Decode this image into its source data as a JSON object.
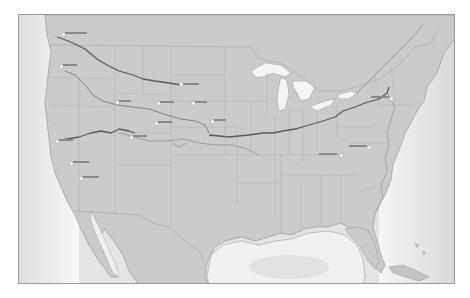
{
  "map": {
    "type": "reference-map",
    "region": "Contiguous United States",
    "style": "grayscale relief",
    "colors": {
      "land": "#c9c9c9",
      "water": "#ececec",
      "deep_water": "#dcdcdc",
      "route": "#5a5a5a",
      "state_border": "#a8a8a8",
      "lakes": "#f4f4f4",
      "frame": "#9a9a9a"
    },
    "routes": [
      {
        "name": "route-1",
        "description": "Northwest route from Washington coast to northern plains"
      },
      {
        "name": "route-2",
        "description": "Route from Idaho/Oregon area east through plains"
      },
      {
        "name": "route-3",
        "description": "Route from northern California across Nevada/Utah"
      },
      {
        "name": "route-4",
        "description": "Central transcontinental route from plains to New York"
      }
    ],
    "labels": [
      {
        "id": "label-1",
        "x": 44,
        "y": 18
      },
      {
        "id": "label-2",
        "x": 42,
        "y": 50
      },
      {
        "id": "label-3",
        "x": 98,
        "y": 86
      },
      {
        "id": "label-4",
        "x": 186,
        "y": 54
      },
      {
        "id": "label-5",
        "x": 140,
        "y": 87
      },
      {
        "id": "label-6",
        "x": 48,
        "y": 121
      },
      {
        "id": "label-7",
        "x": 113,
        "y": 121
      },
      {
        "id": "label-8",
        "x": 175,
        "y": 86
      },
      {
        "id": "label-9",
        "x": 138,
        "y": 107
      },
      {
        "id": "label-10",
        "x": 194,
        "y": 104
      },
      {
        "id": "label-11",
        "x": 52,
        "y": 147
      },
      {
        "id": "label-12",
        "x": 62,
        "y": 162
      },
      {
        "id": "label-13",
        "x": 373,
        "y": 82
      },
      {
        "id": "label-14",
        "x": 350,
        "y": 131
      },
      {
        "id": "label-15",
        "x": 322,
        "y": 139
      }
    ],
    "note": "Map labels are present but not legible at screenshot resolution"
  }
}
